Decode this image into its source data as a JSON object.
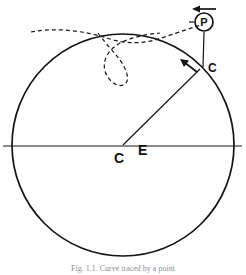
{
  "figure": {
    "caption": "Fig. 1.1. Curve traced by a point",
    "background_color": "#ffffff",
    "line_color": "#141414",
    "dashed_curve_color": "#1a1a1a"
  },
  "labels": {
    "center_point": "C",
    "earth": "E",
    "circle_point": "C",
    "tracing_point": "P"
  },
  "icons": {
    "direction_arrow": "arrow-left-icon",
    "tangent_arrow": "arrow-up-left-icon",
    "point_marker": "circled-p-icon"
  },
  "geometry": {
    "circle_center_x": 123,
    "circle_center_y": 145,
    "circle_radius": 111,
    "point_c_x": 201,
    "point_c_y": 68,
    "point_p_x": 204,
    "point_p_y": 22,
    "diameter_left_x": 3,
    "diameter_right_x": 242,
    "diameter_y": 146
  }
}
